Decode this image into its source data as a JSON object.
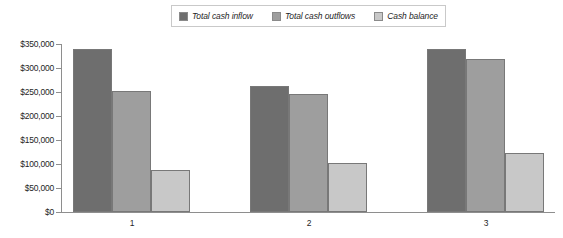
{
  "chart_data": {
    "type": "bar",
    "title": "",
    "subtitle": "",
    "xlabel": "",
    "ylabel": "",
    "categories": [
      "1",
      "2",
      "3"
    ],
    "series": [
      {
        "name": "Total cash inflow",
        "color": "#6e6e6e",
        "values": [
          340000,
          263000,
          340000
        ]
      },
      {
        "name": "Total cash outflows",
        "color": "#9e9e9e",
        "values": [
          252000,
          246000,
          318000
        ]
      },
      {
        "name": "Cash balance",
        "color": "#c8c8c8",
        "values": [
          88000,
          102000,
          123000
        ]
      }
    ],
    "ylim": [
      0,
      350000
    ],
    "ytick_values": [
      0,
      50000,
      100000,
      150000,
      200000,
      250000,
      300000,
      350000
    ],
    "ytick_labels": [
      "$0",
      "$50,000",
      "$100,000",
      "$150,000",
      "$200,000",
      "$250,000",
      "$300,000",
      "$350,000"
    ],
    "grid": false,
    "legend_position": "top-center",
    "legend_entries": [
      "Total cash inflow",
      "Total cash outflows",
      "Cash balance"
    ]
  },
  "legend": {
    "items": [
      {
        "label": "Total cash inflow"
      },
      {
        "label": "Total cash outflows"
      },
      {
        "label": "Cash balance"
      }
    ]
  },
  "axis": {
    "y_labels": [
      "$350,000",
      "$300,000",
      "$250,000",
      "$200,000",
      "$150,000",
      "$100,000",
      "$50,000",
      "$0"
    ],
    "x_labels": [
      "1",
      "2",
      "3"
    ]
  }
}
